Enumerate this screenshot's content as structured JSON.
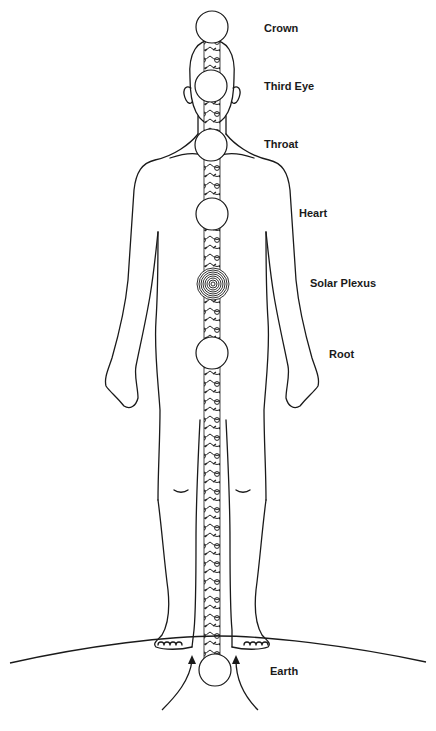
{
  "diagram": {
    "type": "chakra-body-diagram",
    "line_color": "#1a1a1a",
    "background": "#ffffff",
    "chakras": [
      {
        "name": "Crown",
        "cx": 212,
        "cy": 27,
        "r": 16,
        "style": "plain"
      },
      {
        "name": "Third Eye",
        "cx": 211,
        "cy": 86,
        "r": 16,
        "style": "plain"
      },
      {
        "name": "Throat",
        "cx": 211,
        "cy": 145,
        "r": 16,
        "style": "plain"
      },
      {
        "name": "Heart",
        "cx": 212,
        "cy": 214,
        "r": 16,
        "style": "plain"
      },
      {
        "name": "Solar Plexus",
        "cx": 213,
        "cy": 284,
        "r": 16,
        "style": "concentric"
      },
      {
        "name": "Root",
        "cx": 212,
        "cy": 353,
        "r": 16,
        "style": "plain"
      },
      {
        "name": "Earth",
        "cx": 215,
        "cy": 670,
        "r": 16,
        "style": "plain"
      }
    ],
    "labels": {
      "crown": "Crown",
      "third_eye": "Third Eye",
      "throat": "Throat",
      "heart": "Heart",
      "solar_plexus": "Solar Plexus",
      "root": "Root",
      "earth": "Earth"
    }
  }
}
